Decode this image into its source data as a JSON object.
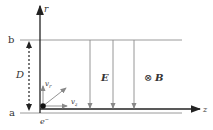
{
  "diagram": {
    "axes": {
      "r_label": "r",
      "z_label": "z"
    },
    "plates": {
      "top_label": "b",
      "bottom_label": "a"
    },
    "separation_label": "D",
    "particle": {
      "label": "e",
      "label_sup": "−",
      "vr_label": "v",
      "vr_sub": "r",
      "vz_label": "v",
      "vz_sub": "z"
    },
    "fields": {
      "electric_label": "E",
      "magnetic_symbol": "⊗",
      "magnetic_label": "B"
    },
    "colors": {
      "axis": "#222222",
      "plate": "#999999",
      "field_arrow": "#8a8a8a",
      "vector": "#888888"
    }
  }
}
